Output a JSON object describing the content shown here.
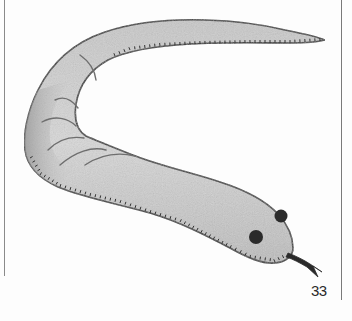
{
  "illustration": {
    "subject": "Pencil drawing of a snake-like creature (worm/eel) with two dark eyes and a forked tongue",
    "features": [
      "body",
      "tail",
      "head",
      "left-eye",
      "right-eye",
      "forked-tongue",
      "belly-stitch-marks",
      "body-creases"
    ]
  },
  "page": {
    "number": "33"
  },
  "colors": {
    "body_fill": "#d4d4d4",
    "body_shade": "#a9a9a9",
    "outline": "#3a3a3a",
    "eye": "#2b2b2b",
    "border": "#7a7a7a"
  }
}
